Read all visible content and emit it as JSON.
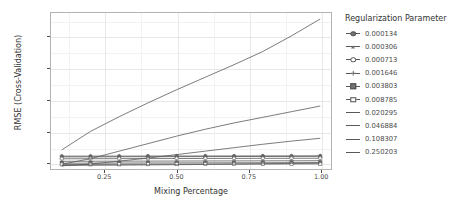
{
  "chart_data": {
    "type": "line",
    "title": "",
    "xlabel": "Mixing Percentage",
    "ylabel": "RMSE (Cross-Validation)",
    "xlim": [
      0.0625,
      1.0375
    ],
    "ylim": [
      0.1395,
      0.3885
    ],
    "x_ticks": [
      "0.25",
      "0.50",
      "0.75",
      "1.00"
    ],
    "x_tick_values": [
      0.25,
      0.5,
      0.75,
      1.0
    ],
    "y_ticks": [
      "0.15",
      "0.20",
      "0.25",
      "0.30",
      "0.35"
    ],
    "y_tick_values": [
      0.15,
      0.2,
      0.25,
      0.3,
      0.35
    ],
    "grid": true,
    "legend_position": "right",
    "legend_title": "Regularization Parameter",
    "x": [
      0.1,
      0.2,
      0.3,
      0.4,
      0.5,
      0.6,
      0.7,
      0.8,
      0.9,
      1.0
    ],
    "series": [
      {
        "name": "0.000134",
        "marker": "circle",
        "has_points": true,
        "values": [
          0.16,
          0.1601,
          0.1601,
          0.1602,
          0.1602,
          0.1603,
          0.1603,
          0.1604,
          0.1604,
          0.1605
        ]
      },
      {
        "name": "0.000306",
        "marker": "triangle",
        "has_points": true,
        "values": [
          0.1588,
          0.1589,
          0.159,
          0.1591,
          0.1592,
          0.1593,
          0.1594,
          0.1595,
          0.1596,
          0.1597
        ]
      },
      {
        "name": "0.000713",
        "marker": "circle-open",
        "has_points": true,
        "values": [
          0.1558,
          0.1559,
          0.156,
          0.1561,
          0.1562,
          0.1563,
          0.1564,
          0.1565,
          0.1566,
          0.1567
        ]
      },
      {
        "name": "0.001646",
        "marker": "plus",
        "has_points": true,
        "values": [
          0.1518,
          0.1519,
          0.152,
          0.1521,
          0.1522,
          0.1523,
          0.1524,
          0.1525,
          0.1526,
          0.1527
        ]
      },
      {
        "name": "0.003803",
        "marker": "square",
        "has_points": true,
        "values": [
          0.1488,
          0.1489,
          0.149,
          0.1491,
          0.1492,
          0.1493,
          0.1494,
          0.1495,
          0.1496,
          0.1497
        ]
      },
      {
        "name": "0.008785",
        "marker": "square-open",
        "has_points": true,
        "values": [
          0.1468,
          0.1469,
          0.147,
          0.1471,
          0.1472,
          0.1473,
          0.1474,
          0.1475,
          0.1476,
          0.1477
        ]
      },
      {
        "name": "0.020295",
        "marker": "none",
        "has_points": false,
        "values": [
          0.1452,
          0.1454,
          0.1457,
          0.146,
          0.1464,
          0.1468,
          0.1473,
          0.1478,
          0.1484,
          0.149
        ]
      },
      {
        "name": "0.046884",
        "marker": "none",
        "has_points": false,
        "values": [
          0.1445,
          0.1475,
          0.152,
          0.157,
          0.1625,
          0.168,
          0.1735,
          0.179,
          0.184,
          0.1885
        ]
      },
      {
        "name": "0.108307",
        "marker": "none",
        "has_points": false,
        "values": [
          0.147,
          0.156,
          0.168,
          0.18,
          0.192,
          0.203,
          0.213,
          0.222,
          0.231,
          0.24
        ]
      },
      {
        "name": "0.250203",
        "marker": "none",
        "has_points": false,
        "values": [
          0.17,
          0.1995,
          0.223,
          0.245,
          0.266,
          0.286,
          0.306,
          0.327,
          0.352,
          0.379
        ]
      }
    ],
    "colors": {
      "line": "#595959",
      "point": "#737373",
      "grid": "#e8e8e8",
      "panel_border": "#b3b3b3",
      "text": "#4d4d4d",
      "background": "#ffffff"
    }
  }
}
